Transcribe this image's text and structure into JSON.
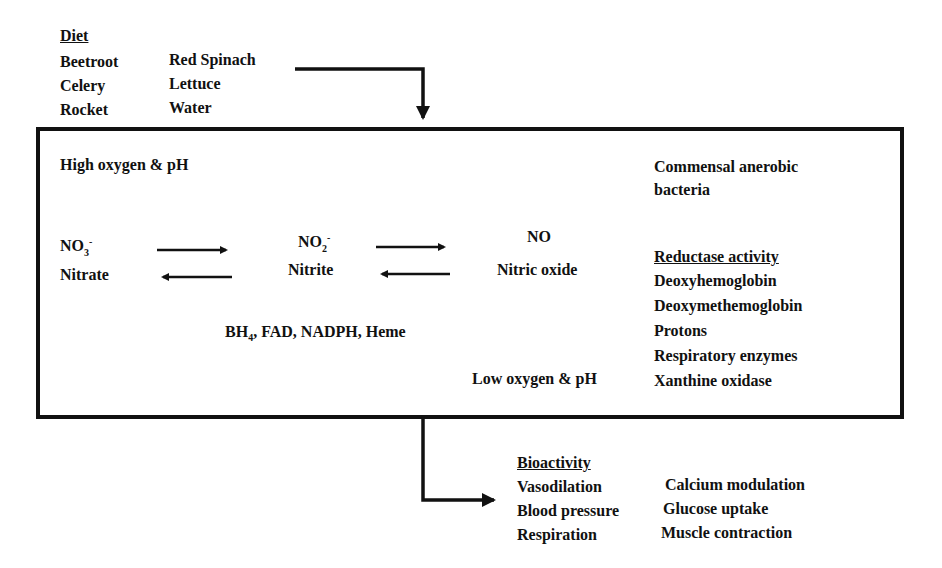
{
  "diet": {
    "heading": "Diet",
    "col1": [
      "Beetroot",
      "Celery",
      "Rocket"
    ],
    "col2": [
      "Red Spinach",
      "Lettuce",
      "Water"
    ]
  },
  "box": {
    "high_condition": "High oxygen & pH",
    "low_condition": "Low oxygen & pH",
    "species": [
      {
        "formula": "NO",
        "sub": "3",
        "sup": "-",
        "name": "Nitrate"
      },
      {
        "formula": "NO",
        "sub": "2",
        "sup": "-",
        "name": "Nitrite"
      },
      {
        "formula": "NO",
        "sub": "",
        "sup": "",
        "name": "Nitric oxide"
      }
    ],
    "cofactors": {
      "pre": "BH",
      "sub": "4",
      "post": ", FAD, NADPH, Heme"
    },
    "bacteria": [
      "Commensal anerobic",
      "bacteria"
    ],
    "reductase": {
      "heading": "Reductase activity",
      "items": [
        "Deoxyhemoglobin",
        "Deoxymethemoglobin",
        "Protons",
        "Respiratory enzymes",
        "Xanthine oxidase"
      ]
    }
  },
  "bioactivity": {
    "heading": "Bioactivity",
    "col1": [
      "Vasodilation",
      "Blood pressure",
      "Respiration"
    ],
    "col2": [
      "Calcium modulation",
      "Glucose uptake",
      "Muscle contraction"
    ]
  },
  "colors": {
    "line": "#111111",
    "background": "#ffffff"
  }
}
